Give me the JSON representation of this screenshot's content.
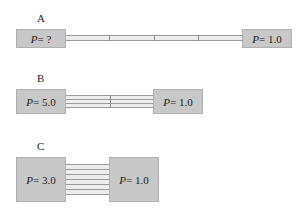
{
  "panels": [
    {
      "label": "A",
      "left": {
        "var": "P",
        "text": " = ?"
      },
      "right": {
        "var": "P",
        "text": " = 1.0"
      },
      "tubes": 1
    },
    {
      "label": "B",
      "left": {
        "var": "P",
        "text": " = 5.0"
      },
      "right": {
        "var": "P",
        "text": " = 1.0"
      },
      "tubes": 3
    },
    {
      "label": "C",
      "left": {
        "var": "P",
        "text": " = 3.0"
      },
      "right": {
        "var": "P",
        "text": " = 1.0"
      },
      "tubes": 6
    }
  ]
}
